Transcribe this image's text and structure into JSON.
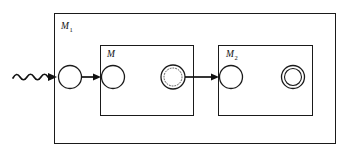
{
  "diagram": {
    "type": "state-machine-composition-diagram",
    "background_color": "#ffffff",
    "line_color": "#111111",
    "outer_machine": {
      "label_main": "M",
      "label_subscript": "1",
      "label_full": "M1"
    },
    "inner_machines": [
      {
        "id": "machine-m",
        "label_main": "M",
        "label_subscript": "",
        "label_full": "M"
      },
      {
        "id": "machine-m2",
        "label_main": "M",
        "label_subscript": "2",
        "label_full": "M2"
      }
    ],
    "nodes": [
      {
        "id": "start-state",
        "kind": "plain-circle"
      },
      {
        "id": "m-start-state",
        "kind": "plain-circle"
      },
      {
        "id": "m-dotted-state",
        "kind": "dotted-circle"
      },
      {
        "id": "m2-start-state",
        "kind": "plain-circle"
      },
      {
        "id": "m2-accept-state",
        "kind": "double-circle"
      }
    ],
    "edges": [
      {
        "id": "input-wave",
        "kind": "wavy-arrow"
      },
      {
        "id": "edge-start-to-m",
        "kind": "straight-arrow"
      },
      {
        "id": "edge-m-to-m2",
        "kind": "straight-arrow"
      }
    ]
  }
}
